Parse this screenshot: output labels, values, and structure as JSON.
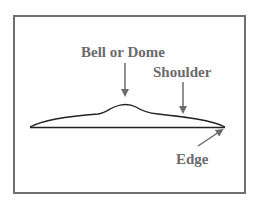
{
  "diagram": {
    "colors": {
      "frame": "#707070",
      "text": "#6b6b6b",
      "outline": "#222222",
      "arrow": "#6b6b6b",
      "background": "#ffffff"
    },
    "labels": {
      "bell": "Bell or Dome",
      "shoulder": "Shoulder",
      "edge": "Edge"
    },
    "arrows": [
      {
        "target": "bell",
        "direction": "down"
      },
      {
        "target": "shoulder",
        "direction": "down"
      },
      {
        "target": "edge",
        "direction": "up-right"
      }
    ]
  }
}
